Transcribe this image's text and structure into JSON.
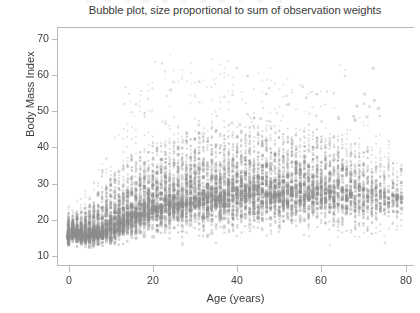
{
  "chart_data": {
    "type": "scatter",
    "title": "Bubble plot, size proportional to sum of observation weights",
    "xlabel": "Age (years)",
    "ylabel": "Body Mass Index",
    "xlim": [
      -2.5,
      82
    ],
    "ylim": [
      7.5,
      73
    ],
    "xticks": [
      0,
      20,
      40,
      60,
      80
    ],
    "xtick_labels": [
      "0",
      "20",
      "40",
      "60",
      "80"
    ],
    "yticks": [
      10,
      20,
      30,
      40,
      50,
      60,
      70
    ],
    "ytick_labels": [
      "10",
      "20",
      "30",
      "40",
      "50",
      "60",
      "70"
    ],
    "grid": false,
    "legend": null,
    "marker": {
      "shape": "square",
      "color": "#8c8c8c",
      "edge_color": "#8c8c8c",
      "opacity": 0.42,
      "size_encodes": "sum of observation weights",
      "size_range_px": [
        0.9,
        3.4
      ]
    },
    "x_is_discrete": true,
    "x_step": 1,
    "series": [
      {
        "name": "observations",
        "age_profile": [
          {
            "age": 0,
            "bmi_median": 15.6,
            "bmi_p05": 13.0,
            "bmi_p95": 19.0,
            "bmi_max": 24,
            "density": 1.0
          },
          {
            "age": 1,
            "bmi_median": 16.2,
            "bmi_p05": 13.6,
            "bmi_p95": 19.6,
            "bmi_max": 25,
            "density": 0.98
          },
          {
            "age": 2,
            "bmi_median": 16.2,
            "bmi_p05": 13.8,
            "bmi_p95": 19.8,
            "bmi_max": 26,
            "density": 0.96
          },
          {
            "age": 3,
            "bmi_median": 16.0,
            "bmi_p05": 13.7,
            "bmi_p95": 20.0,
            "bmi_max": 27,
            "density": 0.95
          },
          {
            "age": 4,
            "bmi_median": 16.0,
            "bmi_p05": 13.6,
            "bmi_p95": 20.6,
            "bmi_max": 28,
            "density": 0.94
          },
          {
            "age": 5,
            "bmi_median": 16.1,
            "bmi_p05": 13.6,
            "bmi_p95": 21.4,
            "bmi_max": 30,
            "density": 0.93
          },
          {
            "age": 6,
            "bmi_median": 16.3,
            "bmi_p05": 13.6,
            "bmi_p95": 22.4,
            "bmi_max": 32,
            "density": 0.92
          },
          {
            "age": 7,
            "bmi_median": 16.6,
            "bmi_p05": 13.7,
            "bmi_p95": 23.4,
            "bmi_max": 34,
            "density": 0.91
          },
          {
            "age": 8,
            "bmi_median": 17.0,
            "bmi_p05": 13.8,
            "bmi_p95": 24.6,
            "bmi_max": 36,
            "density": 0.9
          },
          {
            "age": 9,
            "bmi_median": 17.5,
            "bmi_p05": 14.0,
            "bmi_p95": 25.8,
            "bmi_max": 38,
            "density": 0.89
          },
          {
            "age": 10,
            "bmi_median": 18.0,
            "bmi_p05": 14.2,
            "bmi_p95": 27.0,
            "bmi_max": 41,
            "density": 0.88
          },
          {
            "age": 11,
            "bmi_median": 18.6,
            "bmi_p05": 14.5,
            "bmi_p95": 28.2,
            "bmi_max": 43,
            "density": 0.87
          },
          {
            "age": 12,
            "bmi_median": 19.2,
            "bmi_p05": 14.8,
            "bmi_p95": 29.2,
            "bmi_max": 45,
            "density": 0.86
          },
          {
            "age": 13,
            "bmi_median": 19.9,
            "bmi_p05": 15.2,
            "bmi_p95": 30.2,
            "bmi_max": 47,
            "density": 0.85
          },
          {
            "age": 14,
            "bmi_median": 20.5,
            "bmi_p05": 15.6,
            "bmi_p95": 31.0,
            "bmi_max": 49,
            "density": 0.84
          },
          {
            "age": 15,
            "bmi_median": 21.1,
            "bmi_p05": 16.0,
            "bmi_p95": 31.8,
            "bmi_max": 51,
            "density": 0.83
          },
          {
            "age": 16,
            "bmi_median": 21.7,
            "bmi_p05": 16.4,
            "bmi_p95": 32.4,
            "bmi_max": 53,
            "density": 0.82
          },
          {
            "age": 17,
            "bmi_median": 22.2,
            "bmi_p05": 16.8,
            "bmi_p95": 33.0,
            "bmi_max": 55,
            "density": 0.81
          },
          {
            "age": 18,
            "bmi_median": 22.7,
            "bmi_p05": 17.2,
            "bmi_p95": 33.6,
            "bmi_max": 57,
            "density": 0.8
          },
          {
            "age": 19,
            "bmi_median": 23.1,
            "bmi_p05": 17.5,
            "bmi_p95": 34.2,
            "bmi_max": 58,
            "density": 0.79
          },
          {
            "age": 20,
            "bmi_median": 23.5,
            "bmi_p05": 17.8,
            "bmi_p95": 34.8,
            "bmi_max": 59,
            "density": 0.78
          },
          {
            "age": 22,
            "bmi_median": 24.1,
            "bmi_p05": 18.2,
            "bmi_p95": 35.6,
            "bmi_max": 60,
            "density": 0.77
          },
          {
            "age": 25,
            "bmi_median": 24.8,
            "bmi_p05": 18.6,
            "bmi_p95": 36.6,
            "bmi_max": 62,
            "density": 0.76
          },
          {
            "age": 28,
            "bmi_median": 25.4,
            "bmi_p05": 18.9,
            "bmi_p95": 37.4,
            "bmi_max": 63,
            "density": 0.75
          },
          {
            "age": 30,
            "bmi_median": 25.8,
            "bmi_p05": 19.1,
            "bmi_p95": 38.0,
            "bmi_max": 64,
            "density": 0.75
          },
          {
            "age": 35,
            "bmi_median": 26.5,
            "bmi_p05": 19.4,
            "bmi_p95": 38.8,
            "bmi_max": 65,
            "density": 0.74
          },
          {
            "age": 40,
            "bmi_median": 27.0,
            "bmi_p05": 19.6,
            "bmi_p95": 39.2,
            "bmi_max": 64,
            "density": 0.73
          },
          {
            "age": 45,
            "bmi_median": 27.4,
            "bmi_p05": 19.7,
            "bmi_p95": 39.4,
            "bmi_max": 62,
            "density": 0.72
          },
          {
            "age": 50,
            "bmi_median": 27.6,
            "bmi_p05": 19.7,
            "bmi_p95": 39.2,
            "bmi_max": 60,
            "density": 0.7
          },
          {
            "age": 55,
            "bmi_median": 27.7,
            "bmi_p05": 19.6,
            "bmi_p95": 38.8,
            "bmi_max": 58,
            "density": 0.67
          },
          {
            "age": 60,
            "bmi_median": 27.6,
            "bmi_p05": 19.4,
            "bmi_p95": 38.0,
            "bmi_max": 56,
            "density": 0.63
          },
          {
            "age": 65,
            "bmi_median": 27.3,
            "bmi_p05": 19.1,
            "bmi_p95": 37.0,
            "bmi_max": 53,
            "density": 0.57
          },
          {
            "age": 70,
            "bmi_median": 26.8,
            "bmi_p05": 18.7,
            "bmi_p95": 35.6,
            "bmi_max": 49,
            "density": 0.48
          },
          {
            "age": 74,
            "bmi_median": 26.3,
            "bmi_p05": 18.3,
            "bmi_p95": 34.2,
            "bmi_max": 45,
            "density": 0.4
          },
          {
            "age": 77,
            "bmi_median": 25.8,
            "bmi_p05": 18.0,
            "bmi_p95": 33.0,
            "bmi_max": 42,
            "density": 0.34
          },
          {
            "age": 79,
            "bmi_median": 25.4,
            "bmi_p05": 17.8,
            "bmi_p95": 32.0,
            "bmi_max": 40,
            "density": 0.28
          }
        ]
      }
    ]
  }
}
